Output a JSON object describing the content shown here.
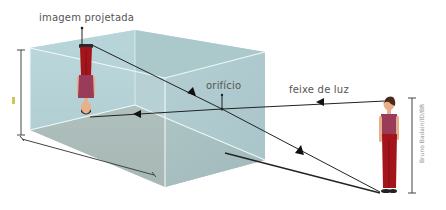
{
  "diagram": {
    "type": "pinhole-camera",
    "labels": {
      "projected_image": "imagem projetada",
      "pinhole": "orifício",
      "light_beam": "feixe de luz"
    },
    "credit": "Bruno Badain/ID/BR",
    "colors": {
      "box_face_light": "#b9d6da",
      "box_face_mid": "#a9c6ca",
      "box_floor": "#9fa99f",
      "box_edge": "#e8f4f5",
      "ray": "#222222",
      "dimension_line": "#444444",
      "shirt": "#9b3b5a",
      "pants": "#a3151b",
      "skin": "#e8b08a",
      "hair": "#4a2a1a"
    }
  }
}
